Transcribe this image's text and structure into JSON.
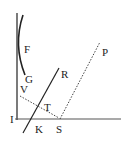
{
  "diagram": {
    "labels": {
      "F": "F",
      "G": "G",
      "R": "R",
      "P": "P",
      "V": "V",
      "T": "T",
      "I": "I",
      "K": "K",
      "S": "S"
    },
    "colors": {
      "stroke": "#222222",
      "background": "#ffffff"
    }
  }
}
